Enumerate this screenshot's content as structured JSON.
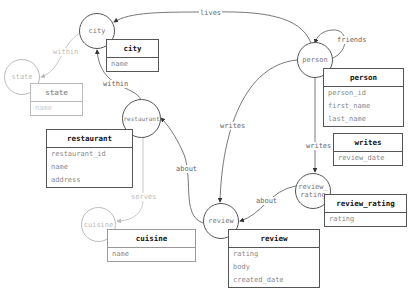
{
  "nodes": {
    "city": {
      "label": "city"
    },
    "state": {
      "label": "state"
    },
    "person": {
      "label": "person"
    },
    "restaurant": {
      "label": "restaurant"
    },
    "cuisine": {
      "label": "cuisine"
    },
    "review": {
      "label": "review"
    },
    "review_rating": {
      "label_line1": "review_",
      "label_line2": "rating"
    }
  },
  "tables": {
    "city": {
      "title": "city",
      "fields": [
        "name"
      ]
    },
    "state": {
      "title": "state",
      "fields": [
        "name"
      ]
    },
    "person": {
      "title": "person",
      "fields": [
        "person_id",
        "first_name",
        "last_name"
      ]
    },
    "writes": {
      "title": "writes",
      "fields": [
        "review_date"
      ]
    },
    "restaurant": {
      "title": "restaurant",
      "fields": [
        "restaurant_id",
        "name",
        "address"
      ]
    },
    "cuisine": {
      "title": "cuisine",
      "fields": [
        "name"
      ]
    },
    "review_rating": {
      "title": "review_rating",
      "fields": [
        "rating"
      ]
    },
    "review": {
      "title": "review",
      "fields": [
        "rating",
        "body",
        "created_date"
      ]
    }
  },
  "edges": {
    "lives": "lives",
    "friends": "friends",
    "within_state": "within",
    "within_city": "within",
    "writes_review": "writes",
    "writes_rating": "writes",
    "about_restaurant": "about",
    "about_review": "about",
    "serves": "serves"
  },
  "colors": {
    "active": "#555555",
    "dimmed": "#bbbbbb"
  }
}
